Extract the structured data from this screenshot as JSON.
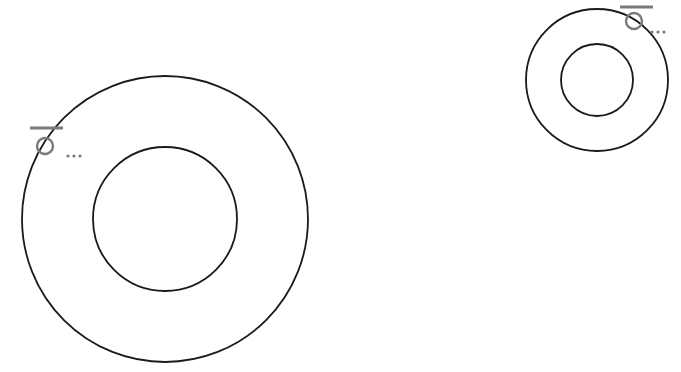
{
  "diagram": {
    "background": "#ffffff",
    "stroke_color": "#1a1a1a",
    "symbol_color": "#7a7a7a",
    "rings": [
      {
        "name": "large-ring",
        "center": [
          165,
          219
        ],
        "outer_radius": 143,
        "inner_radius": 72,
        "symbol": {
          "icon": "diameter-symbol-with-ellipsis",
          "glyph": "Ø...",
          "circle_center": [
            45,
            146
          ],
          "circle_radius": 8,
          "bar": [
            30,
            128,
            63,
            128
          ],
          "dots": [
            [
              68,
              156
            ],
            [
              74,
              156
            ],
            [
              80,
              156
            ]
          ]
        }
      },
      {
        "name": "small-ring",
        "center": [
          597,
          80
        ],
        "outer_radius": 71,
        "inner_radius": 36,
        "symbol": {
          "icon": "diameter-symbol-with-ellipsis",
          "glyph": "Ø...",
          "circle_center": [
            634,
            21
          ],
          "circle_radius": 8,
          "bar": [
            620,
            7,
            653,
            7
          ],
          "dots": [
            [
              652,
              32
            ],
            [
              658,
              32
            ],
            [
              664,
              32
            ]
          ]
        }
      }
    ]
  }
}
